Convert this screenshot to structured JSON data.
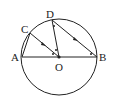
{
  "diagram": {
    "type": "circle-geometry",
    "circle": {
      "center": "O",
      "cx": 59,
      "cy": 57,
      "r": 38
    },
    "points": {
      "A": {
        "label": "A",
        "x": 22,
        "y": 57
      },
      "B": {
        "label": "B",
        "x": 97,
        "y": 57
      },
      "C": {
        "label": "C",
        "x": 30,
        "y": 33
      },
      "D": {
        "label": "D",
        "x": 52,
        "y": 20
      },
      "O": {
        "label": "O",
        "x": 59,
        "y": 57
      }
    },
    "segments": [
      "AB",
      "AC",
      "CO",
      "DO",
      "DB"
    ],
    "parallel_marks": [
      "CO",
      "DB"
    ],
    "colors": {
      "stroke": "#222222",
      "background": "#ffffff"
    }
  }
}
